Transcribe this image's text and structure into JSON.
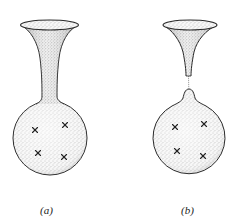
{
  "figure": {
    "panels": [
      {
        "id": "a",
        "label": "(a)",
        "description": "Funnel connected by continuous neck to spherical bulb",
        "marks": 4
      },
      {
        "id": "b",
        "label": "(b)",
        "description": "Funnel separated from bulb by thin pinched thread",
        "marks": 4
      }
    ],
    "colors": {
      "stroke": "#2a2a2a",
      "stipple": "#7a7a7a",
      "fill": "#f3f3f3"
    }
  }
}
